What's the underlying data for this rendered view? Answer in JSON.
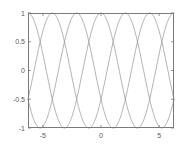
{
  "figure": {
    "background_color": "#ffffff",
    "axes_color": "#7a7a7a",
    "tick_label_color": "#5a5a5a",
    "curve_color": "#8c8c8c",
    "width": 183,
    "height": 157
  },
  "chart_data": {
    "type": "line",
    "title": "",
    "xlabel": "",
    "ylabel": "",
    "xlim": [
      -6.2832,
      6.2832
    ],
    "ylim": [
      -1,
      1
    ],
    "grid": false,
    "legend": "none",
    "xticks": [
      -5,
      0,
      5
    ],
    "xticklabels": [
      "-5",
      "0",
      "5"
    ],
    "yticks": [
      -1,
      -0.5,
      0,
      0.5,
      1
    ],
    "yticklabels": [
      "-1",
      "-0.5",
      "0",
      "0.5",
      "1"
    ],
    "series": [
      {
        "name": "cos(x)",
        "color": "#8c8c8c",
        "phase": 0.0,
        "amplitude": 1,
        "period": 6.2832,
        "description": "cosine, peaks at x = -6.28, 0, 6.28"
      },
      {
        "name": "cos(x - 2.094)",
        "color": "#8c8c8c",
        "phase": 2.0944,
        "amplitude": 1,
        "period": 6.2832,
        "description": "cosine shifted +2pi/3, peaks at x = -4.19, 2.09"
      },
      {
        "name": "cos(x + 2.094)",
        "color": "#8c8c8c",
        "phase": -2.0944,
        "amplitude": 1,
        "period": 6.2832,
        "description": "cosine shifted -2pi/3, peaks at x = -2.09, 4.19"
      }
    ]
  },
  "plot_box": {
    "left": 28,
    "top": 13,
    "right": 174,
    "bottom": 128
  }
}
